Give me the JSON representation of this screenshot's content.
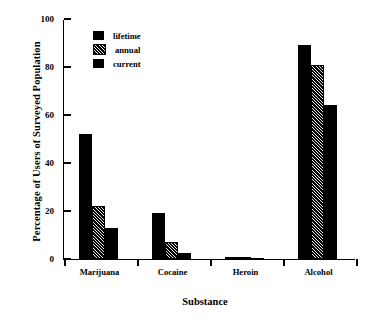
{
  "chart_data": {
    "type": "bar",
    "title": "",
    "xlabel": "Substance",
    "ylabel": "Percentage of Users of Surveyed Population",
    "categories": [
      "Marijuana",
      "Cocaine",
      "Heroin",
      "Alcohol"
    ],
    "series": [
      {
        "name": "lifetime",
        "fill": "solid",
        "values": [
          52,
          19,
          1,
          89
        ]
      },
      {
        "name": "annual",
        "fill": "hatch",
        "values": [
          22,
          7,
          0.5,
          81
        ]
      },
      {
        "name": "current",
        "fill": "solid",
        "values": [
          13,
          2.5,
          0.5,
          64
        ]
      }
    ],
    "ylim": [
      0,
      100
    ],
    "yticks": [
      0,
      20,
      40,
      60,
      80,
      100
    ],
    "ytick_labels": [
      "0",
      "20",
      "40",
      "60",
      "80",
      "100"
    ],
    "grid": false,
    "legend_position": "top-left-inside",
    "legend_entries": [
      "lifetime",
      "annual",
      "current"
    ],
    "colors": {
      "bar": "#000000",
      "axis": "#000000",
      "background": "#ffffff"
    }
  }
}
